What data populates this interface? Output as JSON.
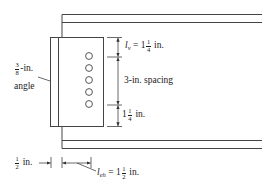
{
  "diagram": {
    "type": "bolted-angle-shear-connection",
    "colors": {
      "line": "#333333",
      "text": "#1a1a1a",
      "background": "#ffffff"
    },
    "angle": {
      "label_fraction_num": "3",
      "label_fraction_den": "8",
      "label_suffix": "-in.",
      "label_line2": "angle"
    },
    "bolts": {
      "count": 5
    },
    "dimensions": {
      "lv": {
        "symbol": "l",
        "subscript": "v",
        "equals": " = 1",
        "frac_num": "1",
        "frac_den": "4",
        "unit": " in."
      },
      "spacing": {
        "text": "3-in. spacing"
      },
      "bottom_edge": {
        "whole": "1",
        "frac_num": "1",
        "frac_den": "4",
        "unit": " in."
      },
      "gap": {
        "frac_num": "1",
        "frac_den": "2",
        "unit": " in."
      },
      "leh": {
        "symbol": "l",
        "subscript": "eh",
        "equals": " = 1",
        "frac_num": "1",
        "frac_den": "2",
        "unit": " in."
      }
    }
  }
}
